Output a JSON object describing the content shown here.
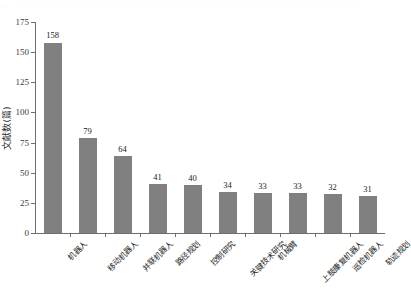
{
  "figure": {
    "top_artifact_text": "。。。 ·· ·· ·· ·· ··· ···· ··· ·· ··· ·· ··· ·· ·· ··· ·· ·· ··· ·· ·· ·· ··· ·· ·· ···· ·· ·· ··· ·· ·· ·· ··· ·· ·· ··· ··· ·· ·· ··· ·· ··· ··",
    "bar_color": "#808080",
    "axis_color": "#6e6e6e",
    "background": "#ffffff"
  },
  "chart_data": {
    "type": "bar",
    "title": "",
    "xlabel": "",
    "ylabel": "文献数(篇)",
    "ylim": [
      0,
      175
    ],
    "yticks": [
      0,
      25,
      50,
      75,
      100,
      125,
      150,
      175
    ],
    "grid": false,
    "legend": false,
    "categories": [
      "机器人",
      "移动机器人",
      "并联机器人",
      "路径规划",
      "控制研究",
      "关键技术研究",
      "机械臂",
      "上肢康复机器人",
      "巡检机器人",
      "轨迹规划"
    ],
    "values": [
      158,
      79,
      64,
      41,
      40,
      34,
      33,
      33,
      32,
      31
    ]
  }
}
